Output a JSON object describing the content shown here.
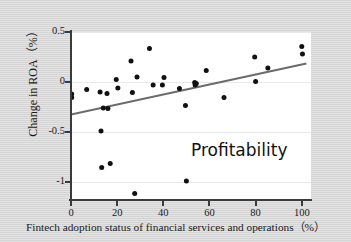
{
  "chart_data": {
    "type": "scatter",
    "title": "",
    "annotation": "Profitability",
    "xlabel": "Fintech adoption status of financial services and operations（%）",
    "ylabel": "Change in ROA（%）",
    "xlim": [
      0,
      104
    ],
    "ylim": [
      -1.17,
      0.5
    ],
    "grid": true,
    "grid_axis": "y",
    "legend": "none",
    "xticks": [
      0,
      20,
      40,
      60,
      80,
      100
    ],
    "xtick_labels": [
      "0",
      "20",
      "40",
      "60",
      "80",
      "100"
    ],
    "yticks": [
      0.5,
      0,
      -0.5,
      -1
    ],
    "ytick_labels": [
      "0.5",
      "0",
      "-0.5",
      "-1"
    ],
    "point_color": "#111111",
    "trendline_color": "#6b6b6b",
    "grid_color": "#e9e9e9",
    "panel_color": "#ffffff",
    "background_color": "#d9d9d9",
    "points": [
      {
        "x": 0.3,
        "y": -0.12
      },
      {
        "x": 0.3,
        "y": -0.155
      },
      {
        "x": 6.8,
        "y": -0.075
      },
      {
        "x": 12.6,
        "y": -0.1
      },
      {
        "x": 13.0,
        "y": -0.49
      },
      {
        "x": 13.3,
        "y": -0.855
      },
      {
        "x": 14.0,
        "y": -0.26
      },
      {
        "x": 15.6,
        "y": -0.115
      },
      {
        "x": 16.0,
        "y": -0.265
      },
      {
        "x": 17.0,
        "y": -0.815
      },
      {
        "x": 19.6,
        "y": 0.025
      },
      {
        "x": 20.3,
        "y": -0.06
      },
      {
        "x": 26.0,
        "y": 0.21
      },
      {
        "x": 26.6,
        "y": -0.105
      },
      {
        "x": 27.6,
        "y": -1.115
      },
      {
        "x": 28.6,
        "y": 0.05
      },
      {
        "x": 34.0,
        "y": 0.335
      },
      {
        "x": 35.6,
        "y": -0.03
      },
      {
        "x": 39.6,
        "y": -0.03
      },
      {
        "x": 40.3,
        "y": 0.045
      },
      {
        "x": 47.0,
        "y": -0.065
      },
      {
        "x": 49.6,
        "y": -0.235
      },
      {
        "x": 50.0,
        "y": -0.99
      },
      {
        "x": 53.6,
        "y": -0.005
      },
      {
        "x": 53.8,
        "y": -0.03
      },
      {
        "x": 54.3,
        "y": -0.015
      },
      {
        "x": 58.6,
        "y": 0.115
      },
      {
        "x": 66.3,
        "y": -0.155
      },
      {
        "x": 79.6,
        "y": 0.25
      },
      {
        "x": 80.0,
        "y": 0.005
      },
      {
        "x": 85.3,
        "y": 0.14
      },
      {
        "x": 100.0,
        "y": 0.355
      },
      {
        "x": 100.3,
        "y": 0.28
      }
    ],
    "trendline": {
      "x_start": 0,
      "y_start": -0.325,
      "x_end": 102,
      "y_end": 0.185
    }
  }
}
